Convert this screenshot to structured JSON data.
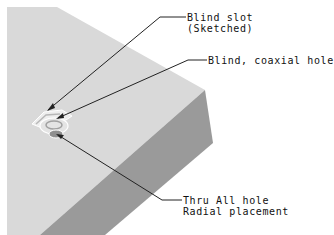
{
  "figure": {
    "colors": {
      "background": "#ffffff",
      "top_face": "#d9d9d9",
      "side_face": "#9a9a9a",
      "leader": "#222222",
      "text": "#111111"
    }
  },
  "callouts": [
    {
      "id": "blind-slot",
      "line1": "Blind slot",
      "line2": "(Sketched)"
    },
    {
      "id": "blind-coaxial-hole",
      "line1": "Blind, coaxial hole"
    },
    {
      "id": "thru-all-hole",
      "line1": "Thru All hole",
      "line2": "Radial placement"
    }
  ]
}
